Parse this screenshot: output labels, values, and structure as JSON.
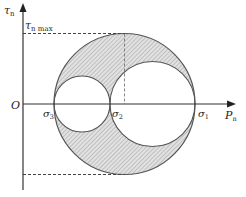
{
  "diagram": {
    "type": "mohr-circle",
    "axes": {
      "y_label": "τ",
      "y_label_sub": "n",
      "x_label": "P",
      "x_label_sub": "n",
      "origin_label": "O"
    },
    "annotations": {
      "tau_max": "τ",
      "tau_max_sub": "n max"
    },
    "points": [
      {
        "label": "σ",
        "sub": "3"
      },
      {
        "label": "σ",
        "sub": "2"
      },
      {
        "label": "σ",
        "sub": "1"
      }
    ],
    "circles": [
      {
        "name": "outer",
        "from": "σ3",
        "to": "σ1"
      },
      {
        "name": "small",
        "from": "σ3",
        "to": "σ2"
      },
      {
        "name": "medium",
        "from": "σ2",
        "to": "σ1"
      }
    ],
    "colors": {
      "fill": "#d8d8d8",
      "stroke": "#555555",
      "axis": "#333333"
    }
  }
}
